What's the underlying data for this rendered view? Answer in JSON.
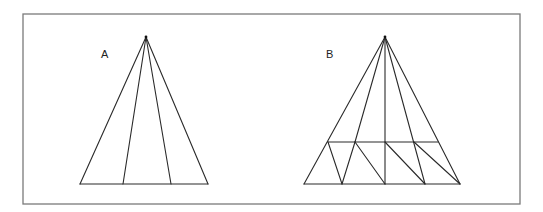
{
  "diagram": {
    "type": "geometric-triangle-puzzle",
    "frame": {
      "x": 23,
      "y": 14,
      "width": 497,
      "height": 190,
      "stroke": "#7a7a7a"
    },
    "figures": [
      {
        "id": "A",
        "label": "A",
        "label_pos": {
          "x": 101,
          "y": 58
        },
        "apex": {
          "x": 146,
          "y": 37
        },
        "segments": [
          {
            "from": [
              146,
              37
            ],
            "to": [
              80,
              184
            ]
          },
          {
            "from": [
              146,
              37
            ],
            "to": [
              123,
              184
            ]
          },
          {
            "from": [
              146,
              37
            ],
            "to": [
              171,
              184
            ]
          },
          {
            "from": [
              146,
              37
            ],
            "to": [
              208,
              184
            ]
          },
          {
            "from": [
              80,
              184
            ],
            "to": [
              208,
              184
            ]
          }
        ]
      },
      {
        "id": "B",
        "label": "B",
        "label_pos": {
          "x": 326,
          "y": 58
        },
        "apex": {
          "x": 385,
          "y": 37
        },
        "segments": [
          {
            "from": [
              385,
              37
            ],
            "to": [
              304,
              184
            ]
          },
          {
            "from": [
              385,
              37
            ],
            "to": [
              355,
              142
            ]
          },
          {
            "from": [
              385,
              37
            ],
            "to": [
              385,
              184
            ]
          },
          {
            "from": [
              385,
              37
            ],
            "to": [
              425,
              184
            ]
          },
          {
            "from": [
              385,
              37
            ],
            "to": [
              460,
              184
            ]
          },
          {
            "from": [
              304,
              184
            ],
            "to": [
              460,
              184
            ]
          },
          {
            "from": [
              328,
              142
            ],
            "to": [
              438,
              142
            ]
          },
          {
            "from": [
              328,
              142
            ],
            "to": [
              342,
              184
            ]
          },
          {
            "from": [
              355,
              142
            ],
            "to": [
              342,
              184
            ]
          },
          {
            "from": [
              355,
              142
            ],
            "to": [
              385,
              184
            ]
          },
          {
            "from": [
              385,
              142
            ],
            "to": [
              425,
              184
            ]
          },
          {
            "from": [
              414,
              142
            ],
            "to": [
              460,
              184
            ]
          }
        ]
      }
    ]
  }
}
